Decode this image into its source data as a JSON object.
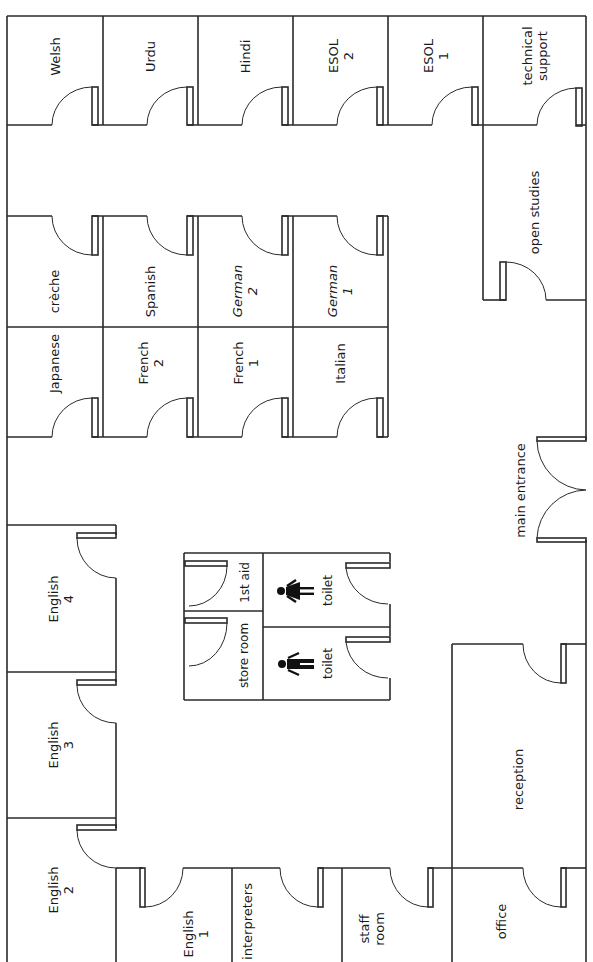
{
  "title_partial": "g y",
  "floor_plan": {
    "rooms": [
      {
        "id": "welsh",
        "label": "Welsh"
      },
      {
        "id": "urdu",
        "label": "Urdu"
      },
      {
        "id": "hindi",
        "label": "Hindi"
      },
      {
        "id": "esol2",
        "label": "ESOL\n2"
      },
      {
        "id": "esol1",
        "label": "ESOL\n1"
      },
      {
        "id": "technical-support",
        "label": "technical\nsupport"
      },
      {
        "id": "open-studies",
        "label": "open studies"
      },
      {
        "id": "creche",
        "label": "crèche"
      },
      {
        "id": "spanish",
        "label": "Spanish"
      },
      {
        "id": "german2",
        "label": "German\n2"
      },
      {
        "id": "german1",
        "label": "German\n1"
      },
      {
        "id": "japanese",
        "label": "Japanese"
      },
      {
        "id": "french2",
        "label": "French\n2"
      },
      {
        "id": "french1",
        "label": "French\n1"
      },
      {
        "id": "italian",
        "label": "Italian"
      },
      {
        "id": "main-entrance",
        "label": "main entrance"
      },
      {
        "id": "english4",
        "label": "English\n4"
      },
      {
        "id": "english3",
        "label": "English\n3"
      },
      {
        "id": "english2",
        "label": "English\n2"
      },
      {
        "id": "english1",
        "label": "English\n1"
      },
      {
        "id": "interpreters",
        "label": "interpreters"
      },
      {
        "id": "staff-room",
        "label": "staff\nroom"
      },
      {
        "id": "office",
        "label": "office"
      },
      {
        "id": "reception",
        "label": "reception"
      },
      {
        "id": "first-aid",
        "label": "1st aid"
      },
      {
        "id": "store-room",
        "label": "store room"
      },
      {
        "id": "toilet-female",
        "label": "toilet"
      },
      {
        "id": "toilet-male",
        "label": "toilet"
      }
    ],
    "icons": [
      {
        "id": "toilet-female",
        "icon": "female-figure-icon"
      },
      {
        "id": "toilet-male",
        "icon": "male-figure-icon"
      }
    ],
    "colors": {
      "line": "#2a2a2a",
      "background": "#ffffff",
      "text": "#1a1a1a"
    }
  }
}
